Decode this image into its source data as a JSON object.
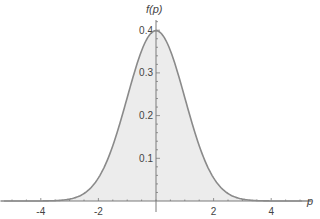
{
  "chart_data": {
    "type": "area",
    "title": "",
    "xlabel": "p",
    "ylabel": "f(p)",
    "function": "standard normal density f(p) = exp(-p^2/2)/sqrt(2*pi)",
    "xlim": [
      -5.4,
      5.4
    ],
    "ylim": [
      0,
      0.42
    ],
    "x_ticks": [
      -4,
      -2,
      2,
      4
    ],
    "x_tick_labels": [
      "-4",
      "-2",
      "2",
      "4"
    ],
    "y_ticks": [
      0.1,
      0.2,
      0.3,
      0.4
    ],
    "y_tick_labels": [
      "0.1",
      "0.2",
      "0.3",
      "0.4"
    ],
    "grid": false,
    "legend": null,
    "x": [
      -5,
      -4,
      -3.5,
      -3,
      -2.5,
      -2,
      -1.5,
      -1,
      -0.5,
      0,
      0.5,
      1,
      1.5,
      2,
      2.5,
      3,
      3.5,
      4,
      5
    ],
    "values": [
      1.5e-06,
      0.0001,
      0.0009,
      0.0044,
      0.0175,
      0.054,
      0.1295,
      0.242,
      0.3521,
      0.3989,
      0.3521,
      0.242,
      0.1295,
      0.054,
      0.0175,
      0.0044,
      0.0009,
      0.0001,
      1.5e-06
    ],
    "colors": {
      "line": "#8a8a8a",
      "fill": "#ececec",
      "axis": "#7a7a7a",
      "text": "#444444"
    }
  }
}
